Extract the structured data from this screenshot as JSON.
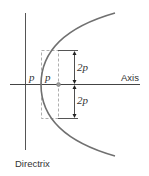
{
  "diagram": {
    "labels": {
      "directrix": "Directrix",
      "axis": "Axis",
      "p_left": "p",
      "p_right": "p",
      "two_p_upper": "2p",
      "two_p_lower": "2p"
    },
    "colors": {
      "curve": "#707070",
      "lines": "#555555",
      "dashed": "#999999",
      "focus": "#888888"
    }
  }
}
